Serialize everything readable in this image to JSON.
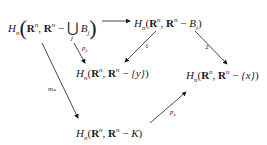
{
  "diagram": {
    "type": "commutative-diagram",
    "nodes": {
      "top_left": {
        "H": "H",
        "sub": "n",
        "R": "R",
        "sup": "n",
        "minus": " − ",
        "union": "⋃",
        "union_index": "j",
        "set": "B",
        "set_index": "j",
        "text": "H_n(R^n, R^n − ⋃_j B_j)"
      },
      "top_right": {
        "text": "H_n(R^n, R^n − B_i)",
        "set": "B",
        "set_index": "i"
      },
      "middle_left": {
        "text": "H_n(R^n, R^n − {y})",
        "set": "{y}"
      },
      "middle_right": {
        "text": "H_n(R^n, R^n − {x})",
        "set": "{x}"
      },
      "bottom": {
        "text": "H_n(R^n, R^n − K)",
        "set": "K"
      }
    },
    "arrows": [
      {
        "from": "top_left",
        "to": "top_right",
        "label": ""
      },
      {
        "from": "top_right",
        "to": "middle_left",
        "label": "1"
      },
      {
        "from": "top_right",
        "to": "middle_right",
        "label": "2"
      },
      {
        "from": "top_left",
        "to": "middle_left",
        "label": "p_y"
      },
      {
        "from": "top_left",
        "to": "bottom",
        "label": "m_*"
      },
      {
        "from": "bottom",
        "to": "middle_right",
        "label": "p_x"
      }
    ],
    "labels": {
      "one": "1",
      "two": "2",
      "p_y": "p",
      "p_y_sub": "y",
      "m_star": "m",
      "m_star_sub": "*",
      "p_x": "p",
      "p_x_sub": "x"
    }
  }
}
